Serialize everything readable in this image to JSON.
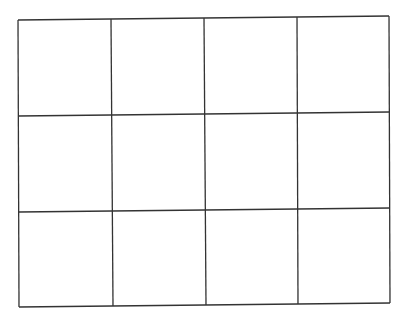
{
  "diagram": {
    "type": "grid",
    "rows": 3,
    "columns": 4,
    "line_color": "#333333",
    "background": "#ffffff",
    "corners": {
      "top_left": [
        18,
        20
      ],
      "top_right": [
        389,
        16
      ],
      "bottom_left": [
        19,
        307
      ],
      "bottom_right": [
        390,
        303
      ]
    },
    "horizontal_lines": [
      {
        "x1": 18,
        "y1": 20,
        "x2": 389,
        "y2": 16
      },
      {
        "x1": 18,
        "y1": 116,
        "x2": 389,
        "y2": 112
      },
      {
        "x1": 19,
        "y1": 212,
        "x2": 390,
        "y2": 208
      },
      {
        "x1": 19,
        "y1": 307,
        "x2": 390,
        "y2": 303
      }
    ],
    "vertical_lines": [
      {
        "x1": 18,
        "y1": 20,
        "x2": 19,
        "y2": 307
      },
      {
        "x1": 111,
        "y1": 19,
        "x2": 113,
        "y2": 306
      },
      {
        "x1": 204,
        "y1": 18,
        "x2": 206,
        "y2": 305
      },
      {
        "x1": 297,
        "y1": 17,
        "x2": 298,
        "y2": 304
      },
      {
        "x1": 389,
        "y1": 16,
        "x2": 390,
        "y2": 303
      }
    ]
  }
}
